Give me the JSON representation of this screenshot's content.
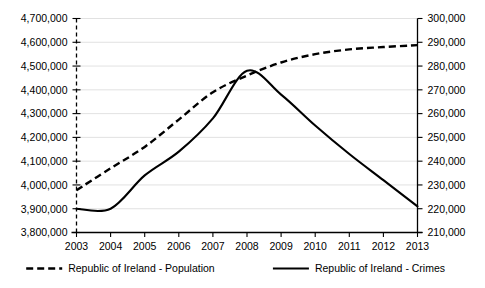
{
  "chart_data": {
    "type": "line",
    "title": "",
    "xlabel": "",
    "grid": true,
    "legend_position": "bottom",
    "categories": [
      "2003",
      "2004",
      "2005",
      "2006",
      "2007",
      "2008",
      "2009",
      "2010",
      "2011",
      "2012",
      "2013"
    ],
    "axes": {
      "left": {
        "label": "",
        "min": 3800000,
        "max": 4700000,
        "step": 100000,
        "ticks": [
          "3,800,000",
          "3,900,000",
          "4,000,000",
          "4,100,000",
          "4,200,000",
          "4,300,000",
          "4,400,000",
          "4,500,000",
          "4,600,000",
          "4,700,000"
        ],
        "tick_values": [
          3800000,
          3900000,
          4000000,
          4100000,
          4200000,
          4300000,
          4400000,
          4500000,
          4600000,
          4700000
        ]
      },
      "right": {
        "label": "",
        "min": 210000,
        "max": 300000,
        "step": 10000,
        "ticks": [
          "210,000",
          "220,000",
          "230,000",
          "240,000",
          "250,000",
          "260,000",
          "270,000",
          "280,000",
          "290,000",
          "300,000"
        ],
        "tick_values": [
          210000,
          220000,
          230000,
          240000,
          250000,
          260000,
          270000,
          280000,
          290000,
          300000
        ]
      }
    },
    "series": [
      {
        "name": "Republic of Ireland - Population",
        "axis": "left",
        "style": "dashed",
        "color": "#000000",
        "values": [
          3978000,
          4070000,
          4160000,
          4275000,
          4390000,
          4460000,
          4515000,
          4550000,
          4570000,
          4580000,
          4588000
        ]
      },
      {
        "name": "Republic of Ireland - Crimes",
        "axis": "right",
        "style": "solid",
        "color": "#000000",
        "values": [
          220000,
          220000,
          234000,
          244000,
          258000,
          278000,
          268000,
          255000,
          243000,
          232000,
          221000
        ]
      }
    ],
    "legend": [
      {
        "label": "Republic of Ireland - Population",
        "style": "dashed"
      },
      {
        "label": "Republic of Ireland - Crimes",
        "style": "solid"
      }
    ]
  }
}
